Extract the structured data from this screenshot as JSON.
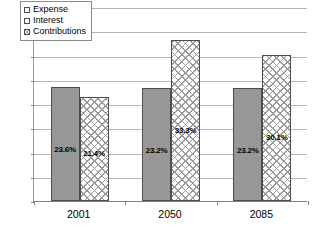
{
  "chart_data": {
    "type": "bar",
    "title": "",
    "xlabel": "",
    "ylabel": "",
    "categories": [
      "2001",
      "2050",
      "2085"
    ],
    "series": [
      {
        "name": "Expense",
        "values": [
          0.0,
          0.0,
          0.0
        ],
        "labels": [
          "0.0%",
          "0.0%",
          "0.0%"
        ],
        "fill": "white",
        "color": "#ffffff"
      },
      {
        "name": "Interest",
        "values": [
          23.6,
          23.2,
          23.2
        ],
        "labels": [
          "23.6%",
          "23.2%",
          "23.2%"
        ],
        "fill": "solid-gray",
        "color": "#979797"
      },
      {
        "name": "Contributions",
        "values": [
          21.4,
          33.3,
          30.1
        ],
        "labels": [
          "21.4%",
          "33.3%",
          "30.1%"
        ],
        "fill": "crosshatch",
        "color": "#9a9a9a"
      }
    ],
    "ylim": [
      0,
      40
    ],
    "ytick_values": [
      0,
      5,
      10,
      15,
      20,
      25,
      30,
      35,
      40
    ],
    "ytick_labels": [
      "0%",
      "5%",
      "10%",
      "15%",
      "20%",
      "25%",
      "30%",
      "35%",
      "40%"
    ],
    "grid": true,
    "legend_position": "upper-left-inside",
    "legend_entries": [
      "Expense",
      "Interest",
      "Contributions"
    ]
  },
  "axes": {
    "y": {
      "ticks": [
        {
          "value": 40,
          "label": "40%"
        },
        {
          "value": 35,
          "label": "35%"
        },
        {
          "value": 30,
          "label": "30%"
        },
        {
          "value": 25,
          "label": "25%"
        },
        {
          "value": 20,
          "label": "20%"
        },
        {
          "value": 15,
          "label": "15%"
        },
        {
          "value": 10,
          "label": "10%"
        },
        {
          "value": 5,
          "label": "5%"
        },
        {
          "value": 0,
          "label": "0%"
        }
      ]
    },
    "x": {
      "ticks": [
        {
          "label": "2001"
        },
        {
          "label": "2050"
        },
        {
          "label": "2085"
        }
      ]
    }
  },
  "legend": {
    "items": [
      {
        "label": "Expense",
        "swatch": "expense-swatch"
      },
      {
        "label": "Interest",
        "swatch": "interest-swatch"
      },
      {
        "label": "Contributions",
        "swatch": "contributions-swatch"
      }
    ]
  }
}
